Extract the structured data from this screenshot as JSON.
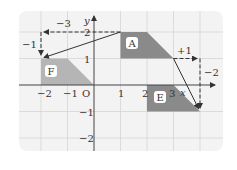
{
  "diagram": {
    "axes": {
      "x_label": "x",
      "y_label": "y",
      "origin_label": "O",
      "x_ticks": [
        "−2",
        "−1",
        "1",
        "2",
        "3"
      ],
      "y_ticks": [
        "2",
        "1",
        "−1",
        "−2"
      ]
    },
    "shapes": [
      {
        "name": "A",
        "vertices": [
          [
            1,
            2
          ],
          [
            2,
            2
          ],
          [
            3,
            1
          ],
          [
            1,
            1
          ]
        ],
        "color": "#8c8c8c"
      },
      {
        "name": "F",
        "vertices": [
          [
            -2,
            1
          ],
          [
            -1,
            1
          ],
          [
            0,
            0
          ],
          [
            -2,
            0
          ]
        ],
        "color": "#b8b8b8"
      },
      {
        "name": "E",
        "vertices": [
          [
            2,
            0
          ],
          [
            3,
            0
          ],
          [
            4,
            -1
          ],
          [
            2,
            -1
          ]
        ],
        "color": "#8c8c8c"
      }
    ],
    "translations": [
      {
        "from": "A",
        "to": "F",
        "dx": "−3",
        "dy": "−1",
        "start": [
          1,
          2
        ],
        "end": [
          -2,
          1
        ]
      },
      {
        "from": "A",
        "to": "E",
        "dx": "+1",
        "dy": "−2",
        "start": [
          3,
          1
        ],
        "end": [
          4,
          -1
        ]
      }
    ],
    "colors": {
      "panel": "#f2f2f2",
      "grid": "#d6d6d6",
      "axis": "#444444",
      "arrow": "#333333"
    }
  }
}
